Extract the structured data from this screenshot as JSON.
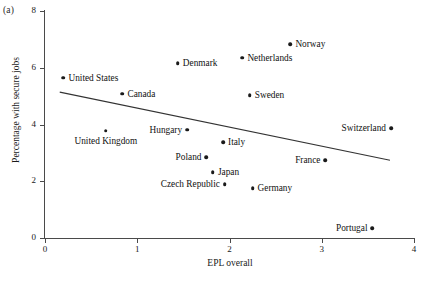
{
  "figure": {
    "panel_a_letter": "(a)",
    "panel_b_letter": "(b)"
  },
  "chart_data": {
    "type": "scatter",
    "title": "",
    "xlabel": "EPL overall",
    "ylabel": "Percentage with secure jobs",
    "xlim": [
      0,
      4
    ],
    "ylim": [
      0,
      8
    ],
    "xticks": [
      "0",
      "1",
      "2",
      "3",
      "4"
    ],
    "yticks": [
      "0",
      "2",
      "4",
      "6",
      "8"
    ],
    "grid": false,
    "legend": "none",
    "points": [
      {
        "label": "United States",
        "x": 0.2,
        "y": 5.65,
        "label_pos": "right"
      },
      {
        "label": "United Kingdom",
        "x": 0.66,
        "y": 3.78,
        "label_pos": "below"
      },
      {
        "label": "Canada",
        "x": 0.84,
        "y": 5.08,
        "label_pos": "right"
      },
      {
        "label": "Denmark",
        "x": 1.44,
        "y": 6.15,
        "label_pos": "right"
      },
      {
        "label": "Hungary",
        "x": 1.54,
        "y": 3.82,
        "label_pos": "left"
      },
      {
        "label": "Poland",
        "x": 1.75,
        "y": 2.85,
        "label_pos": "left"
      },
      {
        "label": "Japan",
        "x": 1.82,
        "y": 2.32,
        "label_pos": "right"
      },
      {
        "label": "Italy",
        "x": 1.93,
        "y": 3.38,
        "label_pos": "right"
      },
      {
        "label": "Czech Republic",
        "x": 1.95,
        "y": 1.9,
        "label_pos": "left"
      },
      {
        "label": "Netherlands",
        "x": 2.14,
        "y": 6.35,
        "label_pos": "right"
      },
      {
        "label": "Sweden",
        "x": 2.22,
        "y": 5.04,
        "label_pos": "right"
      },
      {
        "label": "Germany",
        "x": 2.25,
        "y": 1.76,
        "label_pos": "right"
      },
      {
        "label": "Norway",
        "x": 2.66,
        "y": 6.82,
        "label_pos": "right"
      },
      {
        "label": "France",
        "x": 3.04,
        "y": 2.74,
        "label_pos": "left"
      },
      {
        "label": "Portugal",
        "x": 3.55,
        "y": 0.35,
        "label_pos": "left"
      },
      {
        "label": "Switzerland",
        "x": 3.75,
        "y": 3.87,
        "label_pos": "left"
      }
    ],
    "trend_line": {
      "x0": 0.16,
      "y0": 5.14,
      "x1": 3.74,
      "y1": 2.74
    }
  },
  "panel_b": {
    "tick_label": "8"
  }
}
